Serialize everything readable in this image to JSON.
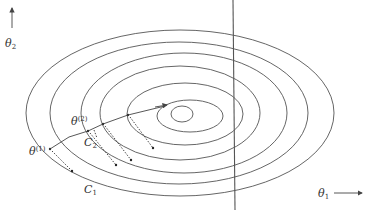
{
  "diagram": {
    "title": "",
    "axes": {
      "x_label": {
        "base": "θ",
        "sub": "1"
      },
      "y_label": {
        "base": "θ",
        "sub": "2"
      }
    },
    "labels": {
      "theta1": {
        "base": "θ",
        "sup": "(1)"
      },
      "theta2": {
        "base": "θ",
        "sup": "(2)"
      },
      "c1": {
        "base": "C",
        "sub": "1"
      },
      "c2": {
        "base": "C",
        "sub": "2"
      }
    },
    "contours": [
      {
        "cx": 180,
        "cy": 113,
        "rx": 154,
        "ry": 83
      },
      {
        "cx": 179,
        "cy": 113,
        "rx": 129,
        "ry": 71
      },
      {
        "cx": 184,
        "cy": 113,
        "rx": 103,
        "ry": 60
      },
      {
        "cx": 180,
        "cy": 113,
        "rx": 80,
        "ry": 47
      },
      {
        "cx": 185,
        "cy": 114,
        "rx": 58,
        "ry": 31
      },
      {
        "cx": 190,
        "cy": 116,
        "rx": 33,
        "ry": 16
      },
      {
        "cx": 182,
        "cy": 114,
        "rx": 11,
        "ry": 8
      }
    ],
    "constraint_line": {
      "x1": 233,
      "y1": 0,
      "x2": 235,
      "y2": 210
    },
    "colors": {
      "stroke": "#555555",
      "text": "#333333"
    }
  }
}
